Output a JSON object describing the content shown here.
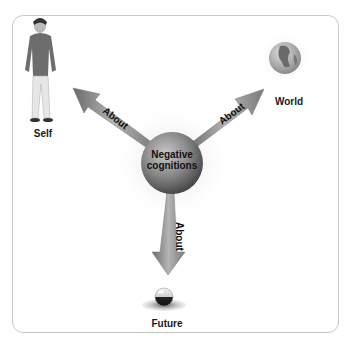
{
  "diagram": {
    "center": {
      "label_line1": "Negative",
      "label_line2": "cognitions"
    },
    "nodes": [
      {
        "id": "self",
        "label": "Self",
        "icon": "person-icon"
      },
      {
        "id": "world",
        "label": "World",
        "icon": "globe-icon"
      },
      {
        "id": "future",
        "label": "Future",
        "icon": "crystal-ball-icon"
      }
    ],
    "edges": [
      {
        "from": "negative-cognitions",
        "to": "self",
        "label": "About"
      },
      {
        "from": "negative-cognitions",
        "to": "world",
        "label": "About"
      },
      {
        "from": "negative-cognitions",
        "to": "future",
        "label": "About"
      }
    ]
  }
}
